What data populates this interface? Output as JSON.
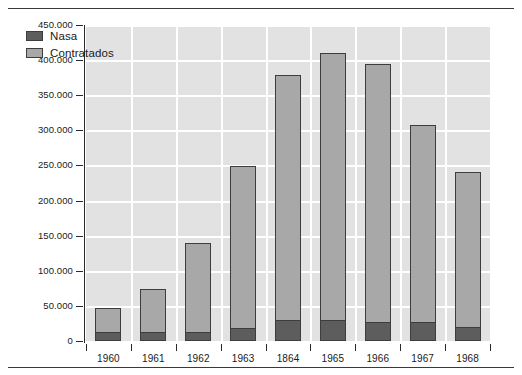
{
  "chart_data": {
    "type": "bar",
    "stacked": true,
    "title": "",
    "subtitle": "",
    "xlabel": "",
    "ylabel": "Número de empregados",
    "categories": [
      "1960",
      "1961",
      "1962",
      "1963",
      "1864",
      "1965",
      "1966",
      "1967",
      "1968"
    ],
    "series": [
      {
        "name": "Nasa",
        "color": "#5d5d5d",
        "values": [
          11000,
          11000,
          11000,
          17000,
          29000,
          29000,
          25000,
          25000,
          18000
        ]
      },
      {
        "name": "Contratados",
        "color": "#a8a8a8",
        "values": [
          36000,
          63000,
          129000,
          232000,
          350000,
          381000,
          370000,
          283000,
          222000
        ]
      }
    ],
    "totals": [
      47000,
      74000,
      140000,
      249000,
      379000,
      410000,
      395000,
      308000,
      240000
    ],
    "ylim": [
      0,
      450000
    ],
    "yticks": [
      0,
      50000,
      100000,
      150000,
      200000,
      250000,
      300000,
      350000,
      400000,
      450000
    ],
    "ytick_labels": [
      "0",
      "50.000",
      "100.000",
      "150.000",
      "200.000",
      "250.000",
      "300.000",
      "350.000",
      "400.000",
      "450.000"
    ],
    "grid": true,
    "grid_color": "#ffffff",
    "plot_background": "#e2e2e2",
    "legend_position": "upper-left-inside",
    "legend_entries": [
      "Nasa",
      "Contratados"
    ],
    "annotations": []
  },
  "figure": {
    "background": "#ffffff",
    "rule_color": "#3a3a3a",
    "axis_color": "#2b2b2b",
    "text_color": "#1a1a1a"
  }
}
